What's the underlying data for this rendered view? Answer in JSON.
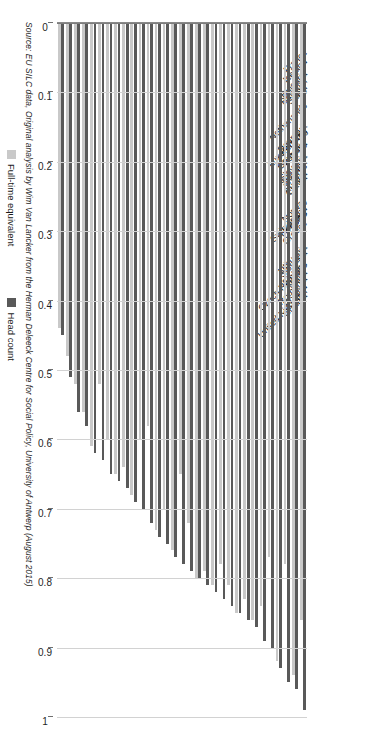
{
  "legend": {
    "entries": [
      {
        "label": "Full-time equivalent",
        "color": "#c9c9c9",
        "key": "fte"
      },
      {
        "label": "Head count",
        "color": "#595959",
        "key": "head"
      }
    ]
  },
  "source": {
    "text": "Source: EU SILC data, Original analysis by Wim Van Lancker from the Herman Deleeck Centre for Social Policy, University of Antwerp (August 2015)"
  },
  "axis": {
    "ticks": [
      "1",
      "0.9",
      "0.8",
      "0.7",
      "0.6",
      "0.5",
      "0.4",
      "0.3",
      "0.2",
      "0.1",
      "0"
    ],
    "tick_values": [
      1,
      0.9,
      0.8,
      0.7,
      0.6,
      0.5,
      0.4,
      0.3,
      0.2,
      0.1,
      0
    ]
  },
  "chart_data": {
    "type": "bar",
    "orientation": "horizontal",
    "title": "",
    "subtitle": "",
    "xlabel": "",
    "ylabel": "",
    "xlim": [
      0,
      1
    ],
    "axis_reversed": true,
    "grid": true,
    "legend_position": "left",
    "categories": [
      "France",
      "Iceland",
      "Bulgaria",
      "Belgium",
      "Netherlands",
      "Spain",
      "Italy",
      "Luxembourg",
      "Denmark",
      "Portugal",
      "Germany",
      "Estonia",
      "Slovenia",
      "Sweden",
      "Cyprus",
      "Austria",
      "Latvia",
      "Switzerland",
      "Norway",
      "Hungary",
      "Ireland",
      "Greece",
      "Czech Republic",
      "Lithuania",
      "Slovakia",
      "United Kingdom",
      "Finland",
      "Romania",
      "Malta",
      "Poland",
      "Croatia"
    ],
    "series": [
      {
        "name": "Head count",
        "color": "#595959",
        "values": [
          0.99,
          0.96,
          0.95,
          0.93,
          0.9,
          0.89,
          0.87,
          0.86,
          0.85,
          0.84,
          0.83,
          0.82,
          0.81,
          0.8,
          0.79,
          0.78,
          0.77,
          0.75,
          0.74,
          0.72,
          0.7,
          0.69,
          0.67,
          0.66,
          0.65,
          0.63,
          0.62,
          0.58,
          0.56,
          0.51,
          0.45
        ]
      },
      {
        "name": "Full-time equivalent",
        "color": "#c9c9c9",
        "values": [
          0.86,
          0.94,
          0.78,
          0.92,
          0.77,
          0.84,
          0.86,
          0.83,
          0.85,
          0.81,
          0.78,
          0.81,
          0.79,
          0.8,
          0.72,
          0.65,
          0.76,
          0.7,
          0.73,
          0.58,
          0.6,
          0.68,
          0.64,
          0.65,
          0.6,
          0.52,
          0.61,
          0.56,
          0.52,
          0.48,
          0.44
        ]
      }
    ]
  }
}
